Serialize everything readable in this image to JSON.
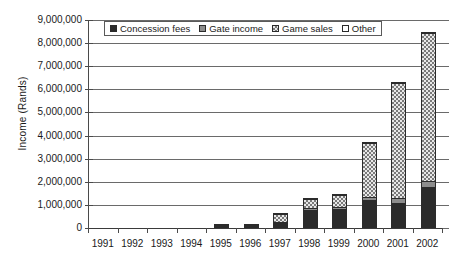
{
  "chart_data": {
    "type": "bar",
    "subtype": "stacked-bar",
    "title": "",
    "xlabel": "",
    "ylabel": "Income (Rands)",
    "ylim": [
      0,
      9000000
    ],
    "ytick_step": 1000000,
    "ytick_labels": [
      "9,000,000",
      "8,000,000",
      "7,000,000",
      "6,000,000",
      "5,000,000",
      "4,000,000",
      "3,000,000",
      "2,000,000",
      "1,000,000",
      "0"
    ],
    "ytick_values": [
      9000000,
      8000000,
      7000000,
      6000000,
      5000000,
      4000000,
      3000000,
      2000000,
      1000000,
      0
    ],
    "grid": true,
    "grid_axis": "y",
    "legend_position": "top-inside",
    "categories": [
      "1991",
      "1992",
      "1993",
      "1994",
      "1995",
      "1996",
      "1997",
      "1998",
      "1999",
      "2000",
      "2001",
      "2002"
    ],
    "series": [
      {
        "name": "Concession fees",
        "color": "#2b2b2b",
        "pattern": "solid-dark",
        "values": [
          0,
          0,
          0,
          0,
          10000,
          40000,
          200000,
          780000,
          820000,
          1200000,
          1100000,
          1760000
        ]
      },
      {
        "name": "Gate income",
        "color": "#8d8d8d",
        "pattern": "solid-gray",
        "values": [
          0,
          0,
          0,
          0,
          10000,
          20000,
          60000,
          120000,
          150000,
          200000,
          230000,
          330000
        ]
      },
      {
        "name": "Game sales",
        "color": "#e8e8e8",
        "pattern": "checkered",
        "values": [
          0,
          0,
          0,
          0,
          5000,
          10000,
          400000,
          450000,
          560000,
          2380000,
          5010000,
          6450000
        ]
      },
      {
        "name": "Other",
        "color": "#ffffff",
        "pattern": "empty",
        "values": [
          0,
          0,
          0,
          0,
          0,
          0,
          10000,
          20000,
          20000,
          20000,
          20000,
          10000
        ]
      }
    ],
    "totals": [
      0,
      0,
      0,
      0,
      25000,
      70000,
      670000,
      1370000,
      1550000,
      3800000,
      6360000,
      8550000
    ]
  },
  "legend": {
    "items": [
      {
        "label": "Concession fees"
      },
      {
        "label": "Gate income"
      },
      {
        "label": "Game sales"
      },
      {
        "label": "Other"
      }
    ]
  }
}
